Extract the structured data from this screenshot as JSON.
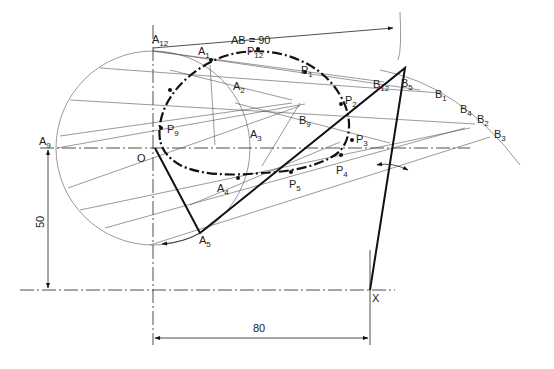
{
  "figure": {
    "type": "mechanism locus construction drawing",
    "dimensions": {
      "ab_label": "AB = 90",
      "height_label": "50",
      "width_label": "80"
    },
    "labels": {
      "A12": {
        "base": "A",
        "sub": "12"
      },
      "A1": {
        "base": "A",
        "sub": "1"
      },
      "A2": {
        "base": "A",
        "sub": "2"
      },
      "A3": {
        "base": "A",
        "sub": "3"
      },
      "A4": {
        "base": "A",
        "sub": "4"
      },
      "A5": {
        "base": "A",
        "sub": "5"
      },
      "A9": {
        "base": "A",
        "sub": "9"
      },
      "P12": {
        "base": "P",
        "sub": "12"
      },
      "P1": {
        "base": "P",
        "sub": "1"
      },
      "P2": {
        "base": "P",
        "sub": "2"
      },
      "P3": {
        "base": "P",
        "sub": "3"
      },
      "P4": {
        "base": "P",
        "sub": "4"
      },
      "P5": {
        "base": "P",
        "sub": "5"
      },
      "P9": {
        "base": "P",
        "sub": "9"
      },
      "B12": {
        "base": "B",
        "sub": "12"
      },
      "B5": {
        "base": "B",
        "sub": "5"
      },
      "B1": {
        "base": "B",
        "sub": "1"
      },
      "B4": {
        "base": "B",
        "sub": "4"
      },
      "B2": {
        "base": "B",
        "sub": "2"
      },
      "B3": {
        "base": "B",
        "sub": "3"
      },
      "B9": {
        "base": "B",
        "sub": "9"
      },
      "O": "O",
      "X": "X"
    },
    "colors": {
      "ink": "#111111",
      "construction": "#555555",
      "background": "#ffffff"
    }
  }
}
